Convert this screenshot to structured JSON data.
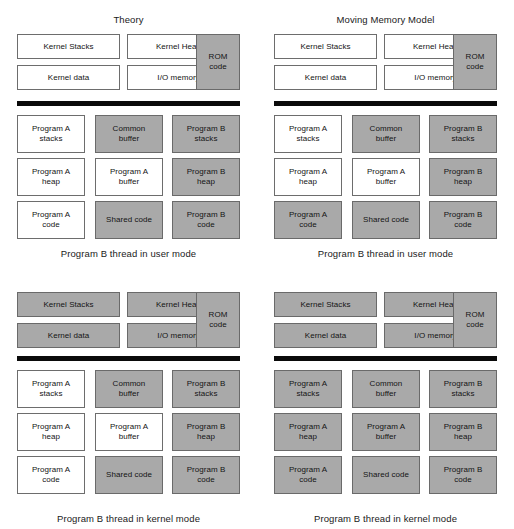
{
  "figure": {
    "kernel_labels": {
      "kernel_stacks": "Kernel Stacks",
      "kernel_heap": "Kernel Heap",
      "kernel_data": "Kernel data",
      "io_memory": "I/O memory",
      "rom_code": "ROM\ncode"
    },
    "program_labels": {
      "a_stacks": "Program A\nstacks",
      "common_buffer": "Common\nbuffer",
      "b_stacks": "Program B\nstacks",
      "a_heap": "Program A\nheap",
      "a_buffer": "Program A\nbuffer",
      "b_heap": "Program B\nheap",
      "a_code": "Program A\ncode",
      "shared_code": "Shared code",
      "b_code": "Program B\ncode"
    },
    "colors": {
      "shaded": "#a9a9a9",
      "unshaded": "#ffffff",
      "border": "#6d6d6d",
      "divider": "#0a0a0a",
      "text": "#141414"
    }
  },
  "panels": [
    {
      "id": "theory-user-mode",
      "position": "top-left",
      "title": "Theory",
      "caption": "Program B thread in user mode",
      "kernel_shaded": {
        "kernel_stacks": false,
        "kernel_heap": false,
        "kernel_data": false,
        "io_memory": false,
        "rom_code": true
      },
      "program_shaded": {
        "a_stacks": false,
        "common_buffer": true,
        "b_stacks": true,
        "a_heap": false,
        "a_buffer": false,
        "b_heap": true,
        "a_code": false,
        "shared_code": true,
        "b_code": true
      }
    },
    {
      "id": "moving-memory-model-user-mode",
      "position": "top-right",
      "title": "Moving Memory Model",
      "caption": "Program B thread in user mode",
      "kernel_shaded": {
        "kernel_stacks": false,
        "kernel_heap": false,
        "kernel_data": false,
        "io_memory": false,
        "rom_code": true
      },
      "program_shaded": {
        "a_stacks": false,
        "common_buffer": true,
        "b_stacks": true,
        "a_heap": false,
        "a_buffer": false,
        "b_heap": true,
        "a_code": true,
        "shared_code": true,
        "b_code": true
      }
    },
    {
      "id": "theory-kernel-mode",
      "position": "bottom-left",
      "title": "",
      "caption": "Program B thread in kernel mode",
      "kernel_shaded": {
        "kernel_stacks": true,
        "kernel_heap": true,
        "kernel_data": true,
        "io_memory": true,
        "rom_code": true
      },
      "program_shaded": {
        "a_stacks": false,
        "common_buffer": true,
        "b_stacks": true,
        "a_heap": false,
        "a_buffer": false,
        "b_heap": true,
        "a_code": false,
        "shared_code": true,
        "b_code": true
      }
    },
    {
      "id": "moving-memory-model-kernel-mode",
      "position": "bottom-right",
      "title": "",
      "caption": "Program B thread in kernel mode",
      "kernel_shaded": {
        "kernel_stacks": true,
        "kernel_heap": true,
        "kernel_data": true,
        "io_memory": true,
        "rom_code": true
      },
      "program_shaded": {
        "a_stacks": true,
        "common_buffer": true,
        "b_stacks": true,
        "a_heap": true,
        "a_buffer": true,
        "b_heap": true,
        "a_code": true,
        "shared_code": true,
        "b_code": true
      }
    }
  ]
}
